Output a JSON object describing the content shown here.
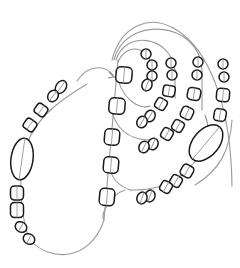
{
  "drawing": {
    "title": "Bead chain sketch",
    "colors": {
      "background": "#ffffff",
      "bead_outline": "#1a1a1a",
      "thread": "#9a9a9a"
    },
    "threads": [
      "M77,81 C90,62 108,66 114,77",
      "M87,84 C60,100 30,120 22,160 C18,200 25,230 30,240 C50,262 90,262 104,220 L118,60",
      "M112,60 C130,-10 230,10 232,186",
      "M114,60 C125,15 200,20 202,70 L202,110",
      "M116,60 C125,30 170,35 175,70 L175,98",
      "M118,62 C128,40 150,50 150,62",
      "M116,70 C120,100 140,110 150,106",
      "M110,105 C115,130 130,140 150,140",
      "M108,160 C110,180 120,186 130,190",
      "M205,115 C215,140 200,160 178,178 C160,190 140,190 130,190",
      "M232,120 C230,150 220,170 195,185",
      "M125,190 C110,195 100,215 104,220"
    ],
    "beads": [
      {
        "shape": "ellipse",
        "cx": 61,
        "cy": 87,
        "rx": 5,
        "ry": 7,
        "rot": 35
      },
      {
        "shape": "ellipse",
        "cx": 53,
        "cy": 96,
        "rx": 5,
        "ry": 6,
        "rot": 35
      },
      {
        "shape": "rect",
        "cx": 41,
        "cy": 110,
        "w": 12,
        "h": 11,
        "rot": 35
      },
      {
        "shape": "rect",
        "cx": 30,
        "cy": 125,
        "w": 12,
        "h": 11,
        "rot": 35
      },
      {
        "shape": "ellipse",
        "cx": 22,
        "cy": 159,
        "rx": 11,
        "ry": 21,
        "rot": 8
      },
      {
        "shape": "rect",
        "cx": 17,
        "cy": 193,
        "w": 13,
        "h": 14,
        "rot": 0
      },
      {
        "shape": "rect",
        "cx": 17,
        "cy": 210,
        "w": 13,
        "h": 15,
        "rot": 0
      },
      {
        "shape": "ellipse",
        "cx": 21,
        "cy": 227,
        "rx": 6,
        "ry": 5,
        "rot": 30
      },
      {
        "shape": "ellipse",
        "cx": 29,
        "cy": 239,
        "rx": 6,
        "ry": 5,
        "rot": 30
      },
      {
        "shape": "rect",
        "cx": 124,
        "cy": 75,
        "w": 16,
        "h": 16,
        "rot": 5
      },
      {
        "shape": "rect",
        "cx": 117,
        "cy": 106,
        "w": 16,
        "h": 16,
        "rot": 5
      },
      {
        "shape": "rect",
        "cx": 112,
        "cy": 137,
        "w": 15,
        "h": 16,
        "rot": 5
      },
      {
        "shape": "rect",
        "cx": 111,
        "cy": 165,
        "w": 15,
        "h": 16,
        "rot": 5
      },
      {
        "shape": "rect",
        "cx": 107,
        "cy": 197,
        "w": 15,
        "h": 17,
        "rot": 5
      },
      {
        "shape": "ellipse",
        "cx": 146,
        "cy": 54,
        "rx": 5,
        "ry": 5,
        "rot": 0
      },
      {
        "shape": "ellipse",
        "cx": 152,
        "cy": 65,
        "rx": 5,
        "ry": 5,
        "rot": 0
      },
      {
        "shape": "ellipse",
        "cx": 152,
        "cy": 76,
        "rx": 5,
        "ry": 5,
        "rot": 0
      },
      {
        "shape": "ellipse",
        "cx": 147,
        "cy": 85,
        "rx": 5,
        "ry": 6,
        "rot": 20
      },
      {
        "shape": "ellipse",
        "cx": 171,
        "cy": 63,
        "rx": 5,
        "ry": 5,
        "rot": 0
      },
      {
        "shape": "ellipse",
        "cx": 172,
        "cy": 75,
        "rx": 5,
        "ry": 5,
        "rot": 0
      },
      {
        "shape": "rect",
        "cx": 169,
        "cy": 91,
        "w": 12,
        "h": 11,
        "rot": 10
      },
      {
        "shape": "rect",
        "cx": 161,
        "cy": 104,
        "w": 11,
        "h": 11,
        "rot": 30
      },
      {
        "shape": "ellipse",
        "cx": 150,
        "cy": 116,
        "rx": 5,
        "ry": 6,
        "rot": 30
      },
      {
        "shape": "ellipse",
        "cx": 142,
        "cy": 122,
        "rx": 5,
        "ry": 6,
        "rot": 30
      },
      {
        "shape": "ellipse",
        "cx": 198,
        "cy": 62,
        "rx": 5,
        "ry": 5,
        "rot": 0
      },
      {
        "shape": "ellipse",
        "cx": 197,
        "cy": 75,
        "rx": 5,
        "ry": 5,
        "rot": 0
      },
      {
        "shape": "rect",
        "cx": 194,
        "cy": 94,
        "w": 13,
        "h": 12,
        "rot": 10
      },
      {
        "shape": "rect",
        "cx": 187,
        "cy": 113,
        "w": 12,
        "h": 12,
        "rot": 25
      },
      {
        "shape": "rect",
        "cx": 178,
        "cy": 126,
        "w": 11,
        "h": 11,
        "rot": 30
      },
      {
        "shape": "rect",
        "cx": 167,
        "cy": 134,
        "w": 11,
        "h": 11,
        "rot": 30
      },
      {
        "shape": "ellipse",
        "cx": 153,
        "cy": 144,
        "rx": 5,
        "ry": 6,
        "rot": 25
      },
      {
        "shape": "ellipse",
        "cx": 144,
        "cy": 147,
        "rx": 5,
        "ry": 6,
        "rot": 25
      },
      {
        "shape": "ellipse",
        "cx": 223,
        "cy": 64,
        "rx": 5,
        "ry": 5,
        "rot": 0
      },
      {
        "shape": "ellipse",
        "cx": 224,
        "cy": 77,
        "rx": 5,
        "ry": 5,
        "rot": 0
      },
      {
        "shape": "rect",
        "cx": 223,
        "cy": 95,
        "w": 13,
        "h": 13,
        "rot": 5
      },
      {
        "shape": "rect",
        "cx": 220,
        "cy": 115,
        "w": 12,
        "h": 12,
        "rot": 10
      },
      {
        "shape": "ellipse",
        "cx": 206,
        "cy": 143,
        "rx": 13,
        "ry": 21,
        "rot": 40
      },
      {
        "shape": "rect",
        "cx": 187,
        "cy": 171,
        "w": 12,
        "h": 12,
        "rot": 30
      },
      {
        "shape": "rect",
        "cx": 176,
        "cy": 181,
        "w": 11,
        "h": 11,
        "rot": 30
      },
      {
        "shape": "rect",
        "cx": 166,
        "cy": 187,
        "w": 11,
        "h": 11,
        "rot": 30
      },
      {
        "shape": "ellipse",
        "cx": 150,
        "cy": 196,
        "rx": 5,
        "ry": 6,
        "rot": 20
      },
      {
        "shape": "ellipse",
        "cx": 142,
        "cy": 198,
        "rx": 5,
        "ry": 6,
        "rot": 20
      }
    ],
    "arrowhead": {
      "x": 114,
      "y": 77
    }
  }
}
